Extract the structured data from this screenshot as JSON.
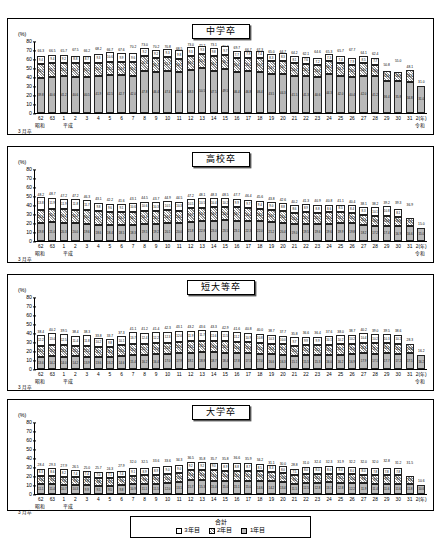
{
  "unit_label": "(%)",
  "axis": {
    "yticks": [
      0,
      10,
      20,
      30,
      40,
      50,
      60,
      70,
      80
    ],
    "ylim": [
      0,
      80
    ],
    "era_showa": "昭和",
    "era_heisei": "平成",
    "era_reiwa": "令和",
    "year_suffix": "(年)",
    "march_label": "3 月卒",
    "categories": [
      "62",
      "63",
      "1",
      "2",
      "3",
      "4",
      "5",
      "6",
      "7",
      "8",
      "9",
      "10",
      "11",
      "12",
      "13",
      "14",
      "15",
      "16",
      "17",
      "18",
      "19",
      "20",
      "21",
      "22",
      "23",
      "24",
      "25",
      "26",
      "27",
      "28",
      "29",
      "30",
      "31",
      "2"
    ]
  },
  "legend": {
    "title": "合計",
    "items": [
      {
        "label": "3年目",
        "swatch": "s3"
      },
      {
        "label": "2年目",
        "swatch": "s2"
      },
      {
        "label": "1年目",
        "swatch": "s1"
      }
    ]
  },
  "chart_data": [
    {
      "type": "bar",
      "title": "中学卒",
      "ylabel": "(%)",
      "ylim": [
        0,
        80
      ],
      "categories": [
        "62",
        "63",
        "1",
        "2",
        "3",
        "4",
        "5",
        "6",
        "7",
        "8",
        "9",
        "10",
        "11",
        "12",
        "13",
        "14",
        "15",
        "16",
        "17",
        "18",
        "19",
        "20",
        "21",
        "22",
        "23",
        "24",
        "25",
        "26",
        "27",
        "28",
        "29",
        "30",
        "31",
        "2"
      ],
      "series": [
        {
          "name": "1年目",
          "values": [
            39.8,
            40.6,
            41.2,
            40.6,
            40.5,
            41.9,
            42.5,
            42.7,
            42.0,
            47.8,
            46.4,
            47.4,
            46.4,
            48.3,
            50.5,
            47.5,
            49.5,
            46.4,
            46.8,
            46.4,
            43.5,
            44.3,
            41.5,
            41.3,
            40.6,
            44.3,
            42.0,
            40.4,
            42.0,
            41.2,
            36.4,
            35.8,
            34.8,
            31.0
          ]
        },
        {
          "name": "2年目",
          "values": [
            15.5,
            15.5,
            15.3,
            15.3,
            15.5,
            15.0,
            15.2,
            14.9,
            15.6,
            16.0,
            15.3,
            15.3,
            14.3,
            16.3,
            15.8,
            16.2,
            16.1,
            15.6,
            15.5,
            15.9,
            14.7,
            14.7,
            14.6,
            14.1,
            13.8,
            14.4,
            14.3,
            13.5,
            14.0,
            13.0,
            11.0,
            10.8,
            13.3,
            null
          ]
        },
        {
          "name": "3年目",
          "values": [
            9.4,
            9.4,
            9.2,
            8.8,
            8.7,
            9.3,
            10.6,
            9.9,
            9.6,
            9.2,
            9.2,
            9.3,
            9.8,
            9.3,
            9.3,
            9.8,
            9.7,
            7.7,
            7.9,
            7.4,
            8.3,
            8.3,
            8.1,
            7.6,
            7.2,
            7.3,
            7.4,
            7.9,
            8.5,
            7.7,
            null,
            null,
            null,
            null
          ]
        }
      ],
      "totals": [
        66.3,
        66.5,
        65.7,
        67.5,
        66.2,
        68.2,
        66.7,
        67.6,
        70.2,
        73.0,
        70.2,
        70.8,
        68.5,
        73.0,
        72.2,
        73.1,
        70.3,
        69.7,
        66.7,
        67.3,
        65.0,
        64.7,
        64.2,
        62.1,
        64.6,
        65.3,
        65.7,
        67.7,
        64.1,
        62.4,
        50.8,
        55.0,
        48.1,
        31.0
      ]
    },
    {
      "type": "bar",
      "title": "高校卒",
      "ylabel": "(%)",
      "ylim": [
        0,
        80
      ],
      "categories": [
        "62",
        "63",
        "1",
        "2",
        "3",
        "4",
        "5",
        "6",
        "7",
        "8",
        "9",
        "10",
        "11",
        "12",
        "13",
        "14",
        "15",
        "16",
        "17",
        "18",
        "19",
        "20",
        "21",
        "22",
        "23",
        "24",
        "25",
        "26",
        "27",
        "28",
        "29",
        "30",
        "31",
        "2"
      ],
      "series": [
        {
          "name": "1年目",
          "values": [
            19.8,
            21.0,
            20.3,
            20.0,
            19.6,
            18.6,
            18.4,
            18.5,
            18.3,
            19.5,
            19.2,
            20.1,
            20.0,
            21.8,
            22.8,
            23.0,
            23.5,
            23.1,
            22.3,
            22.0,
            21.2,
            20.4,
            19.0,
            19.5,
            19.6,
            19.6,
            19.9,
            19.8,
            18.2,
            17.2,
            17.4,
            16.9,
            16.6,
            15.0
          ]
        },
        {
          "name": "2年目",
          "values": [
            15.6,
            15.6,
            15.4,
            15.4,
            15.0,
            14.7,
            14.2,
            14.0,
            14.2,
            14.4,
            14.2,
            14.3,
            14.2,
            14.9,
            14.8,
            14.9,
            14.8,
            14.7,
            14.4,
            14.2,
            13.6,
            13.4,
            12.6,
            12.9,
            12.5,
            12.6,
            12.7,
            12.2,
            11.6,
            10.9,
            10.8,
            10.6,
            9.7,
            null
          ]
        },
        {
          "name": "3年目",
          "values": [
            13.8,
            11.9,
            11.9,
            11.8,
            11.7,
            9.8,
            9.6,
            9.1,
            10.6,
            10.6,
            10.3,
            10.5,
            10.3,
            10.5,
            10.5,
            10.4,
            10.2,
            9.9,
            9.7,
            9.4,
            9.0,
            8.8,
            8.6,
            8.9,
            8.8,
            8.6,
            8.5,
            8.4,
            8.3,
            10.1,
            10.8,
            8.1,
            null,
            null
          ]
        }
      ],
      "totals": [
        48.2,
        48.7,
        47.2,
        47.2,
        46.3,
        43.1,
        42.2,
        41.6,
        43.1,
        44.5,
        43.7,
        44.9,
        44.5,
        47.2,
        48.1,
        48.3,
        48.5,
        47.7,
        46.4,
        45.6,
        43.8,
        42.6,
        40.2,
        41.3,
        40.9,
        40.8,
        41.1,
        40.4,
        38.1,
        38.2,
        39.2,
        39.3,
        36.9,
        15.0
      ]
    },
    {
      "type": "bar",
      "title": "短大等卒",
      "ylabel": "(%)",
      "ylim": [
        0,
        80
      ],
      "categories": [
        "62",
        "63",
        "1",
        "2",
        "3",
        "4",
        "5",
        "6",
        "7",
        "8",
        "9",
        "10",
        "11",
        "12",
        "13",
        "14",
        "15",
        "16",
        "17",
        "18",
        "19",
        "20",
        "21",
        "22",
        "23",
        "24",
        "25",
        "26",
        "27",
        "28",
        "29",
        "30",
        "31",
        "2"
      ],
      "series": [
        {
          "name": "1年目",
          "values": [
            13.6,
            14.2,
            14.0,
            14.2,
            13.9,
            13.6,
            13.2,
            14.6,
            15.4,
            16.2,
            16.4,
            17.0,
            17.9,
            18.1,
            18.8,
            18.7,
            18.4,
            17.8,
            17.5,
            17.0,
            16.6,
            16.3,
            15.1,
            15.5,
            15.3,
            16.0,
            16.2,
            16.9,
            17.9,
            17.1,
            17.7,
            17.2,
            17.5,
            16.2
          ]
        },
        {
          "name": "2年目",
          "values": [
            12.6,
            12.9,
            12.6,
            12.1,
            12.2,
            11.7,
            11.3,
            12.0,
            12.3,
            12.5,
            12.6,
            12.8,
            12.9,
            13.2,
            13.2,
            13.0,
            12.9,
            12.6,
            12.4,
            12.2,
            11.8,
            11.4,
            11.0,
            11.2,
            11.2,
            11.5,
            11.6,
            11.6,
            11.9,
            11.7,
            11.5,
            11.2,
            10.8,
            null
          ]
        },
        {
          "name": "3年目",
          "values": [
            12.2,
            13.0,
            12.5,
            11.4,
            11.8,
            10.2,
            9.8,
            10.1,
            13.7,
            12.4,
            12.2,
            12.3,
            12.0,
            11.9,
            11.7,
            11.6,
            11.5,
            11.2,
            10.9,
            10.8,
            10.3,
            10.0,
            9.7,
            9.9,
            9.9,
            10.1,
            10.2,
            10.2,
            10.4,
            10.2,
            10.3,
            10.2,
            null,
            null
          ]
        }
      ],
      "totals": [
        38.4,
        40.2,
        39.5,
        38.4,
        38.3,
        33.8,
        33.7,
        37.3,
        41.1,
        41.2,
        41.4,
        42.3,
        43.1,
        43.2,
        43.6,
        43.3,
        42.9,
        41.6,
        40.8,
        40.0,
        38.7,
        37.7,
        35.8,
        36.6,
        36.4,
        37.6,
        38.0,
        38.7,
        40.2,
        39.0,
        39.5,
        38.6,
        28.3,
        16.2
      ]
    },
    {
      "type": "bar",
      "title": "大学卒",
      "ylabel": "(%)",
      "ylim": [
        0,
        80
      ],
      "categories": [
        "62",
        "63",
        "1",
        "2",
        "3",
        "4",
        "5",
        "6",
        "7",
        "8",
        "9",
        "10",
        "11",
        "12",
        "13",
        "14",
        "15",
        "16",
        "17",
        "18",
        "19",
        "20",
        "21",
        "22",
        "23",
        "24",
        "25",
        "26",
        "27",
        "28",
        "29",
        "30",
        "31",
        "2"
      ],
      "series": [
        {
          "name": "1年目",
          "values": [
            11.1,
            11.4,
            10.7,
            10.3,
            9.9,
            9.5,
            9.5,
            9.8,
            10.9,
            11.1,
            11.5,
            12.0,
            13.1,
            15.7,
            15.3,
            15.0,
            15.0,
            15.1,
            15.0,
            14.6,
            14.2,
            13.4,
            11.5,
            12.5,
            12.8,
            13.1,
            12.8,
            12.2,
            11.9,
            11.4,
            11.6,
            11.6,
            11.8,
            10.6
          ]
        },
        {
          "name": "2年目",
          "values": [
            9.0,
            9.2,
            9.0,
            9.0,
            8.8,
            8.8,
            8.7,
            9.0,
            9.4,
            9.8,
            10.0,
            10.1,
            10.5,
            11.4,
            11.6,
            11.5,
            11.4,
            11.2,
            11.2,
            10.9,
            10.7,
            10.2,
            9.5,
            10.0,
            10.1,
            10.0,
            10.1,
            10.0,
            9.8,
            9.7,
            9.7,
            9.7,
            8.3,
            null
          ]
        },
        {
          "name": "3年目",
          "values": [
            8.3,
            8.6,
            8.2,
            7.4,
            7.4,
            7.0,
            7.1,
            7.4,
            9.1,
            8.9,
            8.9,
            9.0,
            9.0,
            9.2,
            9.2,
            9.0,
            8.9,
            8.8,
            8.7,
            8.5,
            8.3,
            8.0,
            7.5,
            8.0,
            8.0,
            8.0,
            8.0,
            8.0,
            8.0,
            7.8,
            7.8,
            7.8,
            null,
            null
          ]
        }
      ],
      "totals": [
        28.4,
        29.3,
        27.9,
        26.5,
        25.0,
        25.7,
        24.3,
        27.9,
        32.0,
        32.5,
        33.6,
        33.6,
        34.3,
        36.5,
        35.8,
        35.7,
        35.8,
        36.6,
        35.9,
        34.2,
        31.1,
        30.0,
        28.8,
        31.0,
        32.4,
        32.3,
        31.9,
        32.2,
        32.0,
        32.0,
        32.8,
        31.2,
        31.5,
        10.6
      ]
    }
  ]
}
